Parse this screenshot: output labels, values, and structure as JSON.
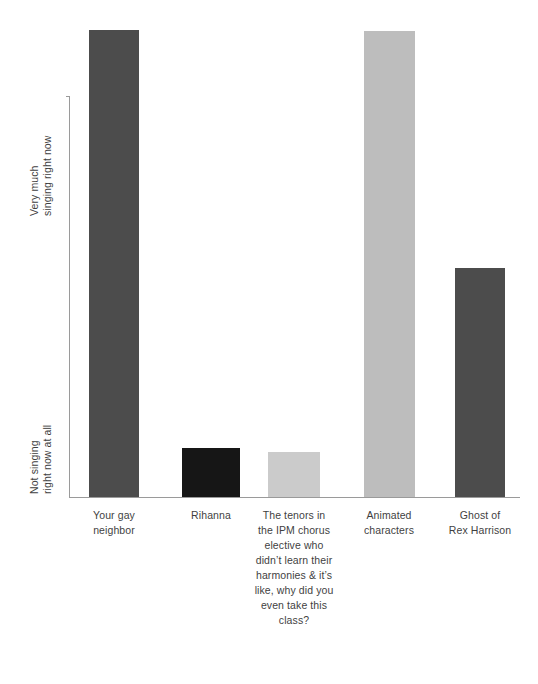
{
  "chart_data": {
    "type": "bar",
    "title": "",
    "subtitle": "",
    "xlabel": "",
    "ylabel": "",
    "grid": false,
    "legend": "none",
    "y_axis": {
      "top_label_line1": "Very much",
      "top_label_line2": "singing right now",
      "bottom_label_line1": "Not singing",
      "bottom_label_line2": "right now at all",
      "ylim": [
        0,
        100
      ],
      "ticks": []
    },
    "categories": [
      "Your gay neighbor",
      "Rihanna",
      "The tenors in the IPM chorus elective who didn’t learn their harmonies & it’s like, why did you even take this class?",
      "Animated characters",
      "Ghost of Rex Harrison"
    ],
    "values": [
      100,
      10.5,
      9.6,
      99.8,
      49
    ],
    "colors": [
      "#4c4c4c",
      "#161616",
      "#cbcbcb",
      "#bdbdbd",
      "#4c4c4c"
    ]
  },
  "bars": [
    {
      "label_lines": [
        "Your gay",
        "neighbor"
      ],
      "value": 100,
      "color": "#4c4c4c",
      "left": 89,
      "width": 50,
      "height": 467,
      "label_left": 69,
      "label_width": 90
    },
    {
      "label_lines": [
        "Rihanna"
      ],
      "value": 10.5,
      "color": "#161616",
      "left": 182,
      "width": 58,
      "height": 49,
      "label_left": 166,
      "label_width": 90
    },
    {
      "label_lines": [
        "The tenors in",
        "the IPM chorus",
        "elective who",
        "didn’t learn their",
        "harmonies & it’s",
        "like, why did you",
        "even take this",
        "class?"
      ],
      "value": 9.6,
      "color": "#cbcbcb",
      "left": 268,
      "width": 52,
      "height": 45,
      "label_left": 243,
      "label_width": 102
    },
    {
      "label_lines": [
        "Animated",
        "characters"
      ],
      "value": 99.8,
      "color": "#bdbdbd",
      "left": 364,
      "width": 51,
      "height": 466,
      "label_left": 344,
      "label_width": 90
    },
    {
      "label_lines": [
        "Ghost of",
        "Rex Harrison"
      ],
      "value": 49,
      "color": "#4c4c4c",
      "left": 455,
      "width": 50,
      "height": 229,
      "label_left": 435,
      "label_width": 90
    }
  ]
}
